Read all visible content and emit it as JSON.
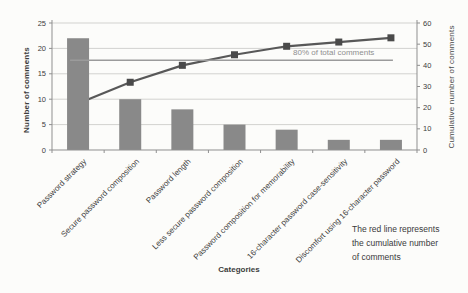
{
  "chart_data": {
    "type": "bar",
    "subtype": "pareto",
    "title": "",
    "categories": [
      "Password strategy",
      "Secure password composition",
      "Password length",
      "Less secure password composition",
      "Password composition for memorability",
      "16-character password case-sensitivity",
      "Discomfort using 16-character password"
    ],
    "series": [
      {
        "name": "Number of comments",
        "kind": "bar",
        "axis": "left",
        "values": [
          22,
          10,
          8,
          5,
          4,
          2,
          2
        ]
      },
      {
        "name": "Cumulative number of comments",
        "kind": "line",
        "axis": "right",
        "values": [
          22,
          32,
          40,
          45,
          49,
          51,
          53
        ]
      },
      {
        "name": "80% of total comments",
        "kind": "reference_line",
        "axis": "right",
        "value": 42.4
      }
    ],
    "xlabel": "Categories",
    "ylabel_left": "Number of comments",
    "ylabel_right": "Cumulative number of comments",
    "ylim_left": [
      0,
      25
    ],
    "ylim_right": [
      0,
      60
    ],
    "yticks_left": [
      0,
      5,
      10,
      15,
      20,
      25
    ],
    "yticks_right": [
      0,
      10,
      20,
      30,
      40,
      50,
      60
    ],
    "grid": true,
    "legend": "none"
  },
  "annotations": {
    "pct_label": "80% of total comments",
    "note_line1": "The red line represents",
    "note_line2": "the cumulative number",
    "note_line3": "of comments"
  },
  "colors": {
    "bar": "#898989",
    "cumulative_line": "#585858",
    "marker": "#4a4a4a",
    "reference_line": "#9b9b9b",
    "gridline": "#d2d2cf",
    "axis": "#8f8f8f",
    "text": "#3c3c3c",
    "muted_text": "#8f8f8f",
    "background": "#fcfcfa"
  }
}
